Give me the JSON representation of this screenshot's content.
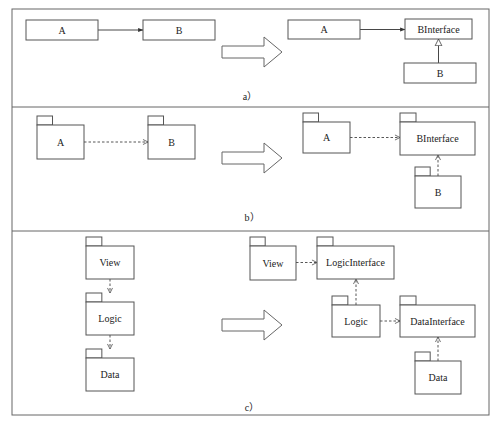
{
  "diagram": {
    "panels": [
      {
        "id": "a",
        "caption": "a）",
        "kind": "class",
        "before": {
          "nodes": [
            {
              "id": "A",
              "label": "A",
              "x": 26,
              "y": 20,
              "w": 72,
              "h": 20
            },
            {
              "id": "B",
              "label": "B",
              "x": 143,
              "y": 20,
              "w": 72,
              "h": 20
            }
          ],
          "edges": [
            {
              "from": "A",
              "to": "B",
              "style": "solid",
              "head": "filled",
              "type": "dependency"
            }
          ]
        },
        "after": {
          "nodes": [
            {
              "id": "A",
              "label": "A",
              "x": 288,
              "y": 20,
              "w": 72,
              "h": 19
            },
            {
              "id": "BInterface",
              "label": "BInterface",
              "x": 405,
              "y": 19,
              "w": 67,
              "h": 20
            },
            {
              "id": "B",
              "label": "B",
              "x": 404,
              "y": 63,
              "w": 72,
              "h": 20
            }
          ],
          "edges": [
            {
              "from": "A",
              "to": "BInterface",
              "style": "solid",
              "head": "filled",
              "type": "dependency"
            },
            {
              "from": "B",
              "to": "BInterface",
              "style": "solid",
              "head": "hollow-triangle",
              "type": "realization"
            }
          ]
        }
      },
      {
        "id": "b",
        "caption": "b）",
        "kind": "package",
        "before": {
          "nodes": [
            {
              "id": "A",
              "label": "A",
              "x": 37,
              "y": 125,
              "w": 47,
              "h": 34
            },
            {
              "id": "B",
              "label": "B",
              "x": 148,
              "y": 125,
              "w": 47,
              "h": 34
            }
          ],
          "edges": [
            {
              "from": "A",
              "to": "B",
              "style": "dashed",
              "head": "open",
              "type": "dependency"
            }
          ]
        },
        "after": {
          "nodes": [
            {
              "id": "A",
              "label": "A",
              "x": 303,
              "y": 122,
              "w": 47,
              "h": 31
            },
            {
              "id": "BInterface",
              "label": "BInterface",
              "x": 400,
              "y": 122,
              "w": 75,
              "h": 33
            },
            {
              "id": "B",
              "label": "B",
              "x": 415,
              "y": 176,
              "w": 46,
              "h": 32
            }
          ],
          "edges": [
            {
              "from": "A",
              "to": "BInterface",
              "style": "dashed",
              "head": "open",
              "type": "dependency"
            },
            {
              "from": "B",
              "to": "BInterface",
              "style": "dashed",
              "head": "open",
              "type": "dependency"
            }
          ]
        }
      },
      {
        "id": "c",
        "caption": "c）",
        "kind": "package",
        "before": {
          "nodes": [
            {
              "id": "View",
              "label": "View",
              "x": 86,
              "y": 246,
              "w": 48,
              "h": 33
            },
            {
              "id": "Logic",
              "label": "Logic",
              "x": 86,
              "y": 302,
              "w": 48,
              "h": 33
            },
            {
              "id": "Data",
              "label": "Data",
              "x": 86,
              "y": 358,
              "w": 48,
              "h": 33
            }
          ],
          "edges": [
            {
              "from": "View",
              "to": "Logic",
              "style": "dashed",
              "head": "open",
              "type": "dependency"
            },
            {
              "from": "Logic",
              "to": "Data",
              "style": "dashed",
              "head": "open",
              "type": "dependency"
            }
          ]
        },
        "after": {
          "nodes": [
            {
              "id": "View",
              "label": "View",
              "x": 250,
              "y": 246,
              "w": 46,
              "h": 34
            },
            {
              "id": "LogicInterface",
              "label": "LogicInterface",
              "x": 317,
              "y": 246,
              "w": 77,
              "h": 33
            },
            {
              "id": "Logic",
              "label": "Logic",
              "x": 332,
              "y": 305,
              "w": 48,
              "h": 32
            },
            {
              "id": "DataInterface",
              "label": "DataInterface",
              "x": 400,
              "y": 305,
              "w": 75,
              "h": 32
            },
            {
              "id": "Data",
              "label": "Data",
              "x": 415,
              "y": 361,
              "w": 46,
              "h": 33
            }
          ],
          "edges": [
            {
              "from": "View",
              "to": "LogicInterface",
              "style": "dashed",
              "head": "open",
              "type": "dependency"
            },
            {
              "from": "Logic",
              "to": "LogicInterface",
              "style": "dashed",
              "head": "open",
              "type": "dependency"
            },
            {
              "from": "Logic",
              "to": "DataInterface",
              "style": "dashed",
              "head": "open",
              "type": "dependency"
            },
            {
              "from": "Data",
              "to": "DataInterface",
              "style": "dashed",
              "head": "open",
              "type": "dependency"
            }
          ]
        }
      }
    ],
    "transform_arrow": "refactor-arrow",
    "colors": {
      "stroke": "#555555",
      "background": "#ffffff",
      "text": "#222222"
    }
  }
}
